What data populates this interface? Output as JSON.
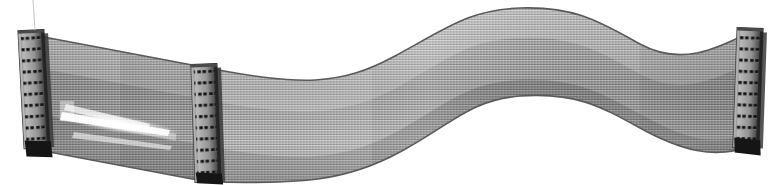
{
  "scene": {
    "title": "IDE ribbon cable with three IDC connectors",
    "width": 776,
    "height": 185,
    "background_color": "#ffffff",
    "object_type": "ribbon-cable-assembly",
    "alt_text": "A flat gray 40-conductor ribbon cable curving in an S shape from lower left to upper right, fitted with three black dual-row IDC connectors."
  },
  "cable": {
    "name": "flat ribbon cable",
    "conductor_count": 40,
    "body_color": "#9c9c9c",
    "stripe_light_color": "#d2d2d2",
    "stripe_dark_color": "#6f6f6f",
    "edge_color": "#5a5a5a",
    "shading_dark_color": "#7a7a7a",
    "shading_light_color": "#c6c6c6",
    "highlight_color": "#ffffff",
    "path_note": "S-curve: descends left-to-middle, rises through middle-to-right crest, descends to right connector"
  },
  "highlight": {
    "name": "specular glare streak",
    "color": "#ffffff",
    "x": 58,
    "y": 98,
    "width": 115,
    "height": 52
  },
  "artifact": {
    "name": "thin vertical scan line above left connector",
    "color": "#c9c9c9",
    "x": 33,
    "y": 0,
    "height": 30
  },
  "connectors": [
    {
      "id": "connector-left",
      "label": "Left IDC connector",
      "position": "left",
      "x": 22,
      "y": 30,
      "width": 25,
      "height": 118,
      "rotation_deg": -3,
      "rows": 2,
      "pins_per_row": 20,
      "body_color": "#4a4a4a",
      "face_color": "#8f8f8f",
      "hole_color": "#1c1c1c",
      "foot_color": "#151515"
    },
    {
      "id": "connector-middle",
      "label": "Middle IDC connector",
      "position": "middle",
      "x": 194,
      "y": 64,
      "width": 25,
      "height": 118,
      "rotation_deg": -2,
      "rows": 2,
      "pins_per_row": 20,
      "body_color": "#4a4a4a",
      "face_color": "#8f8f8f",
      "hole_color": "#1c1c1c",
      "foot_color": "#151515"
    },
    {
      "id": "connector-right",
      "label": "Right IDC connector",
      "position": "right",
      "x": 736,
      "y": 28,
      "width": 25,
      "height": 120,
      "rotation_deg": 2,
      "rows": 2,
      "pins_per_row": 20,
      "body_color": "#4a4a4a",
      "face_color": "#8f8f8f",
      "hole_color": "#1c1c1c",
      "foot_color": "#151515"
    }
  ]
}
